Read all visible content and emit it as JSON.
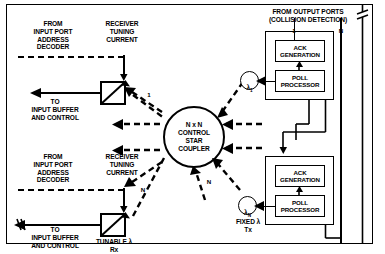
{
  "figure": {
    "title_center": "N x N\nCONTROL\nSTAR\nCOUPLER",
    "top_right_header": "FROM OUTPUT PORTS\n(COLLISION DETECTION)",
    "port_label_1": "1",
    "port_label_N": "N",
    "branch_label_N": "N"
  },
  "upper_receiver": {
    "source_label": "FROM\nINPUT PORT\nADDRESS\nDECODER",
    "tuning_label": "RECEIVER\nTUNING\nCURRENT",
    "output_label": "TO\nINPUT BUFFER\nAND CONTROL",
    "port_index": "1"
  },
  "lower_receiver": {
    "source_label": "FROM\nINPUT PORT\nADDRESS\nDECODER",
    "tuning_label": "RECEIVER\nTUNING\nCURRENT",
    "output_label": "TO\nINPUT BUFFER\nAND CONTROL",
    "device_label": "TUNABLE λ\nRx",
    "port_index": "N"
  },
  "transmitters": {
    "upper_lambda": "λ",
    "upper_lambda_sub": "1",
    "lower_lambda": "λ",
    "lower_lambda_sub": "N",
    "lower_caption": "FIXED λ\nTx"
  },
  "module_upper": {
    "ack_label": "ACK\nGENERATION",
    "poll_label": "POLL\nPROCESSOR"
  },
  "module_lower": {
    "ack_label": "ACK\nGENERATION",
    "poll_label": "POLL\nPROCESSOR"
  },
  "colors": {
    "ink": "#000000",
    "paper": "#ffffff"
  }
}
